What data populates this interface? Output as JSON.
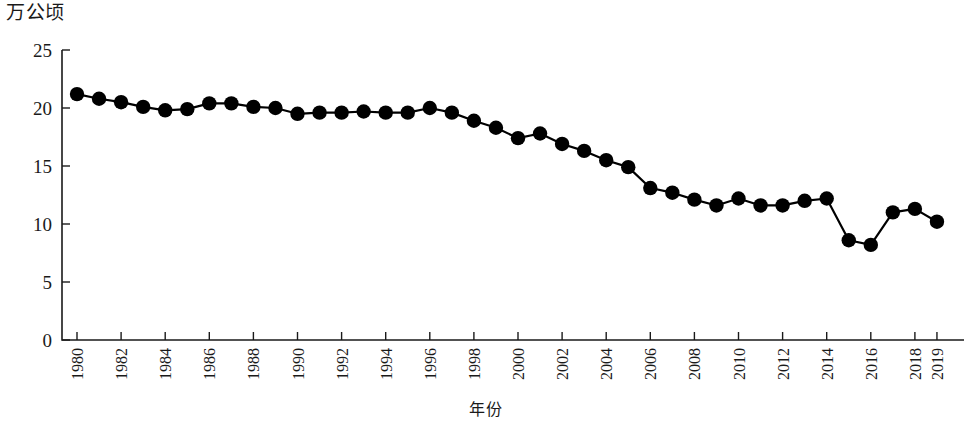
{
  "chart_data": {
    "type": "line",
    "title": "",
    "subtitle": "",
    "xlabel": "年份",
    "ylabel": "万公顷",
    "ylim": [
      0,
      25
    ],
    "yticks": [
      0,
      5,
      10,
      15,
      20,
      25
    ],
    "ytick_labels": [
      "0",
      "5",
      "10",
      "15",
      "20",
      "25"
    ],
    "grid": false,
    "legend": false,
    "legend_position": "none",
    "marker": "filled-circle",
    "line_color": "#000000",
    "marker_color": "#000000",
    "x": [
      1980,
      1981,
      1982,
      1983,
      1984,
      1985,
      1986,
      1987,
      1988,
      1989,
      1990,
      1991,
      1992,
      1993,
      1994,
      1995,
      1996,
      1997,
      1998,
      1999,
      2000,
      2001,
      2002,
      2003,
      2004,
      2005,
      2006,
      2007,
      2008,
      2009,
      2010,
      2011,
      2012,
      2013,
      2014,
      2015,
      2016,
      2017,
      2018,
      2019
    ],
    "xtick_labels": [
      "1980",
      "1982",
      "1984",
      "1986",
      "1988",
      "1990",
      "1992",
      "1994",
      "1996",
      "1998",
      "2000",
      "2002",
      "2004",
      "2006",
      "2008",
      "2010",
      "2012",
      "2014",
      "2016",
      "2018",
      "2019"
    ],
    "xtick_values": [
      1980,
      1982,
      1984,
      1986,
      1988,
      1990,
      1992,
      1994,
      1996,
      1998,
      2000,
      2002,
      2004,
      2006,
      2008,
      2010,
      2012,
      2014,
      2016,
      2018,
      2019
    ],
    "xtick_rotation": 90,
    "values": [
      21.2,
      20.8,
      20.5,
      20.1,
      19.8,
      19.9,
      20.4,
      20.4,
      20.1,
      20.0,
      19.5,
      19.6,
      19.6,
      19.7,
      19.6,
      19.6,
      20.0,
      19.6,
      18.9,
      18.3,
      17.4,
      17.8,
      16.9,
      16.3,
      15.5,
      14.9,
      13.1,
      12.7,
      12.1,
      11.6,
      12.2,
      11.6,
      11.6,
      12.0,
      12.2,
      11.9,
      8.6,
      8.2,
      11.0,
      11.3
    ],
    "last_value": 10.2,
    "series": [
      {
        "name": "面积",
        "values": [
          21.2,
          20.8,
          20.5,
          20.1,
          19.8,
          19.9,
          20.4,
          20.4,
          20.1,
          20.0,
          19.5,
          19.6,
          19.6,
          19.7,
          19.6,
          19.6,
          20.0,
          19.6,
          18.9,
          18.3,
          17.4,
          17.8,
          16.9,
          16.3,
          15.5,
          14.9,
          13.1,
          12.7,
          12.1,
          11.6,
          12.2,
          11.6,
          11.6,
          12.0,
          12.2,
          8.6,
          8.2,
          11.0,
          11.3,
          10.2
        ]
      }
    ]
  }
}
